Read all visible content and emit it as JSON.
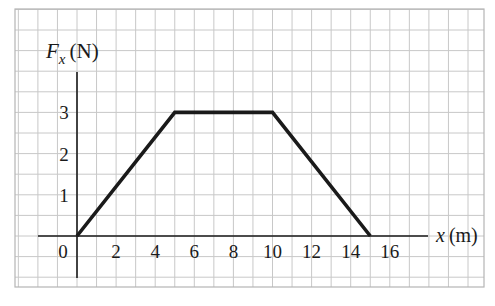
{
  "chart_data": {
    "type": "line",
    "title": "",
    "xlabel_var": "x",
    "xlabel_unit": "(m)",
    "ylabel_var": "F",
    "ylabel_sub": "x",
    "ylabel_unit": "(N)",
    "x": [
      0,
      5,
      10,
      15
    ],
    "y": [
      0,
      3,
      3,
      0
    ],
    "series": [
      {
        "name": "F_x(x)",
        "x": [
          0,
          5,
          10,
          15
        ],
        "values": [
          0,
          3,
          3,
          0
        ]
      }
    ],
    "xticks": [
      "0",
      "2",
      "4",
      "6",
      "8",
      "10",
      "12",
      "14",
      "16"
    ],
    "yticks": [
      "1",
      "2",
      "3"
    ],
    "xlim": [
      -3,
      18
    ],
    "ylim": [
      0,
      3.5
    ],
    "grid": true,
    "legend": "none"
  },
  "colors": {
    "grid": "#c8c8c8",
    "axis": "#1a1a1a",
    "line": "#1a1a1a",
    "background": "#ffffff"
  }
}
